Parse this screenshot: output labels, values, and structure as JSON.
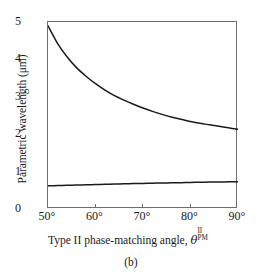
{
  "figure": {
    "caption": "(b)"
  },
  "chart_data": {
    "type": "line",
    "title": "",
    "xlabel_text": "Type II phase-matching angle, ",
    "xlabel_symbol": "θ",
    "xlabel_superscript": "II",
    "xlabel_subscript": "PM",
    "ylabel": "Parametric wavelength (μm)",
    "xlim": [
      50,
      90
    ],
    "ylim": [
      0,
      5
    ],
    "xtick_labels": [
      "50°",
      "60°",
      "70°",
      "80°",
      "90°"
    ],
    "xtick_values": [
      50,
      60,
      70,
      80,
      90
    ],
    "ytick_labels": [
      "0",
      "1",
      "2",
      "3",
      "4",
      "5"
    ],
    "ytick_values": [
      0,
      1,
      2,
      3,
      4,
      5
    ],
    "grid": false,
    "legend": "none",
    "line_color": "#1a1a1a",
    "frame_color": "#6e6e6e",
    "x": [
      50,
      52,
      54,
      56,
      58,
      60,
      62,
      64,
      66,
      68,
      70,
      72,
      74,
      76,
      78,
      80,
      82,
      84,
      86,
      88,
      90
    ],
    "series": [
      {
        "name": "idler branch",
        "values": [
          4.9,
          4.43,
          4.07,
          3.78,
          3.55,
          3.35,
          3.18,
          3.03,
          2.91,
          2.8,
          2.7,
          2.61,
          2.53,
          2.46,
          2.4,
          2.34,
          2.29,
          2.25,
          2.21,
          2.17,
          2.13
        ]
      },
      {
        "name": "signal branch",
        "values": [
          0.62,
          0.627,
          0.634,
          0.641,
          0.648,
          0.655,
          0.661,
          0.667,
          0.673,
          0.679,
          0.685,
          0.69,
          0.695,
          0.7,
          0.705,
          0.71,
          0.715,
          0.719,
          0.723,
          0.727,
          0.73
        ]
      }
    ]
  }
}
